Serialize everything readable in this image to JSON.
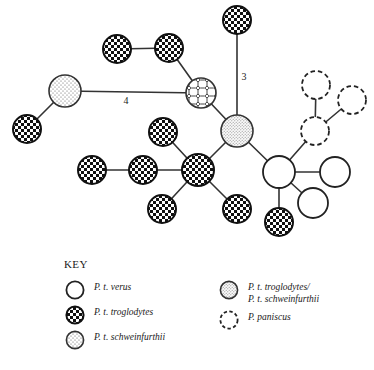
{
  "figure": {
    "type": "haplotype-network-diagram",
    "background_color": "#ffffff",
    "stroke_color": "#1a1a1a"
  },
  "network": {
    "nodes": [
      {
        "id": "n1",
        "label": "",
        "pattern": "checkered",
        "cx": 237,
        "cy": 20,
        "r": 14
      },
      {
        "id": "n2",
        "label": "",
        "pattern": "checkered",
        "cx": 117,
        "cy": 49,
        "r": 14
      },
      {
        "id": "n3",
        "label": "",
        "pattern": "checkered",
        "cx": 169,
        "cy": 48,
        "r": 14
      },
      {
        "id": "n4",
        "label": "",
        "pattern": "schweinfurthii",
        "cx": 65,
        "cy": 91,
        "r": 16
      },
      {
        "id": "n5",
        "label": "",
        "pattern": "segmented",
        "cx": 201,
        "cy": 93,
        "r": 15
      },
      {
        "id": "n6",
        "label": "",
        "pattern": "checkered",
        "cx": 27,
        "cy": 129,
        "r": 14
      },
      {
        "id": "n7",
        "label": "",
        "pattern": "mixed",
        "cx": 237,
        "cy": 131,
        "r": 16
      },
      {
        "id": "n8",
        "label": "",
        "pattern": "checkered",
        "cx": 163,
        "cy": 132,
        "r": 14
      },
      {
        "id": "n9",
        "label": "",
        "pattern": "checkered",
        "cx": 92,
        "cy": 170,
        "r": 14
      },
      {
        "id": "n10",
        "label": "",
        "pattern": "checkered",
        "cx": 143,
        "cy": 170,
        "r": 14
      },
      {
        "id": "n11",
        "label": "",
        "pattern": "checkered",
        "cx": 198,
        "cy": 170,
        "r": 16
      },
      {
        "id": "n12",
        "label": "",
        "pattern": "checkered",
        "cx": 162,
        "cy": 209,
        "r": 14
      },
      {
        "id": "n13",
        "label": "",
        "pattern": "checkered",
        "cx": 237,
        "cy": 209,
        "r": 14
      },
      {
        "id": "n14",
        "label": "",
        "pattern": "verus",
        "cx": 279,
        "cy": 172,
        "r": 16
      },
      {
        "id": "n15",
        "label": "",
        "pattern": "verus",
        "cx": 335,
        "cy": 172,
        "r": 15
      },
      {
        "id": "n16",
        "label": "",
        "pattern": "verus",
        "cx": 313,
        "cy": 203,
        "r": 15
      },
      {
        "id": "n17",
        "label": "",
        "pattern": "checkered",
        "cx": 279,
        "cy": 222,
        "r": 14
      },
      {
        "id": "n18",
        "label": "",
        "pattern": "paniscus",
        "cx": 316,
        "cy": 85,
        "r": 14
      },
      {
        "id": "n19",
        "label": "",
        "pattern": "paniscus",
        "cx": 352,
        "cy": 100,
        "r": 14
      },
      {
        "id": "n20",
        "label": "",
        "pattern": "paniscus",
        "cx": 315,
        "cy": 131,
        "r": 14
      }
    ],
    "edges": [
      {
        "from": "n2",
        "to": "n3",
        "label": ""
      },
      {
        "from": "n3",
        "to": "n5",
        "label": ""
      },
      {
        "from": "n4",
        "to": "n5",
        "label": "4"
      },
      {
        "from": "n4",
        "to": "n6",
        "label": ""
      },
      {
        "from": "n1",
        "to": "n7",
        "label": "3"
      },
      {
        "from": "n5",
        "to": "n7",
        "label": ""
      },
      {
        "from": "n7",
        "to": "n11",
        "label": ""
      },
      {
        "from": "n7",
        "to": "n14",
        "label": ""
      },
      {
        "from": "n8",
        "to": "n11",
        "label": ""
      },
      {
        "from": "n9",
        "to": "n10",
        "label": ""
      },
      {
        "from": "n10",
        "to": "n11",
        "label": ""
      },
      {
        "from": "n11",
        "to": "n12",
        "label": ""
      },
      {
        "from": "n11",
        "to": "n13",
        "label": ""
      },
      {
        "from": "n14",
        "to": "n15",
        "label": ""
      },
      {
        "from": "n14",
        "to": "n16",
        "label": ""
      },
      {
        "from": "n14",
        "to": "n17",
        "label": ""
      },
      {
        "from": "n14",
        "to": "n20",
        "label": ""
      },
      {
        "from": "n18",
        "to": "n20",
        "label": ""
      },
      {
        "from": "n19",
        "to": "n20",
        "label": ""
      }
    ],
    "edge_labels": [
      {
        "text": "3",
        "x": 244,
        "y": 80
      },
      {
        "text": "4",
        "x": 126,
        "y": 104
      }
    ]
  },
  "legend": {
    "title": "KEY",
    "left_items": [
      {
        "pattern": "verus",
        "label": "P. t. verus"
      },
      {
        "pattern": "checkered",
        "label": "P. t. troglodytes"
      },
      {
        "pattern": "schweinfurthii",
        "label": "P. t. schweinfurthii"
      }
    ],
    "right_items": [
      {
        "pattern": "mixed",
        "label": "P. t. troglodytes/\nP. t. schweinfurthii"
      },
      {
        "pattern": "paniscus",
        "label": "P. paniscus"
      }
    ]
  }
}
